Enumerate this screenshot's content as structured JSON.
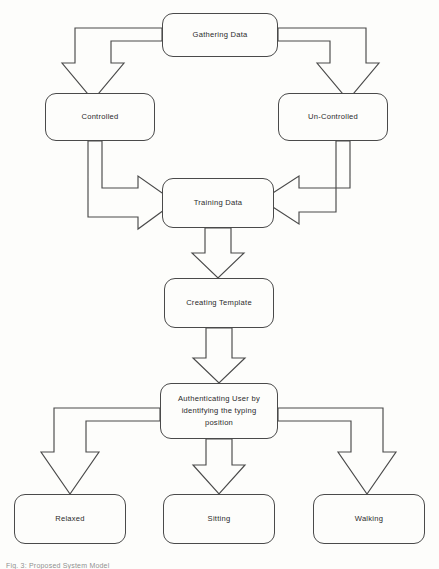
{
  "diagram": {
    "title_caption": "Fig. 3: Proposed System Model",
    "stroke_color": "#4a4a4a",
    "background_color": "#fdfdfb",
    "text_color": "#2b2b2b",
    "type": "flowchart",
    "nodes": [
      {
        "id": "gathering-data",
        "label": "Gathering Data",
        "x": 162,
        "y": 13,
        "w": 116,
        "h": 44
      },
      {
        "id": "controlled",
        "label": "Controlled",
        "x": 45,
        "y": 93,
        "w": 110,
        "h": 48
      },
      {
        "id": "un-controlled",
        "label": "Un-Controlled",
        "x": 278,
        "y": 93,
        "w": 110,
        "h": 48
      },
      {
        "id": "training-data",
        "label": "Training Data",
        "x": 162,
        "y": 178,
        "w": 112,
        "h": 50
      },
      {
        "id": "creating-template",
        "label": "Creating Template",
        "x": 164,
        "y": 278,
        "w": 110,
        "h": 50
      },
      {
        "id": "authenticating-user",
        "label": "Authenticating User by\nidentifying the typing\nposition",
        "x": 160,
        "y": 383,
        "w": 118,
        "h": 56
      },
      {
        "id": "relaxed",
        "label": "Relaxed",
        "x": 14,
        "y": 494,
        "w": 112,
        "h": 50
      },
      {
        "id": "sitting",
        "label": "Sitting",
        "x": 163,
        "y": 494,
        "w": 112,
        "h": 50
      },
      {
        "id": "walking",
        "label": "Walking",
        "x": 313,
        "y": 494,
        "w": 112,
        "h": 50
      }
    ],
    "edges": [
      {
        "id": "edge-gathering-to-controlled",
        "from": "gathering-data",
        "to": "controlled",
        "style": "elbow-down-left"
      },
      {
        "id": "edge-gathering-to-uncontrolled",
        "from": "gathering-data",
        "to": "un-controlled",
        "style": "elbow-down-right"
      },
      {
        "id": "edge-controlled-to-training",
        "from": "controlled",
        "to": "training-data",
        "style": "elbow-down-then-right"
      },
      {
        "id": "edge-uncontrolled-to-training",
        "from": "un-controlled",
        "to": "training-data",
        "style": "elbow-down-then-left"
      },
      {
        "id": "edge-training-to-creating",
        "from": "training-data",
        "to": "creating-template",
        "style": "straight-down"
      },
      {
        "id": "edge-creating-to-authenticating",
        "from": "creating-template",
        "to": "authenticating-user",
        "style": "straight-down"
      },
      {
        "id": "edge-authenticating-to-relaxed",
        "from": "authenticating-user",
        "to": "relaxed",
        "style": "elbow-down-left"
      },
      {
        "id": "edge-authenticating-to-sitting",
        "from": "authenticating-user",
        "to": "sitting",
        "style": "straight-down"
      },
      {
        "id": "edge-authenticating-to-walking",
        "from": "authenticating-user",
        "to": "walking",
        "style": "elbow-down-right"
      }
    ]
  }
}
